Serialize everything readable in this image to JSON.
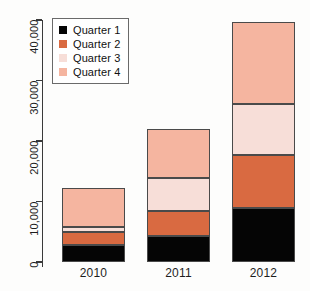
{
  "chart_data": {
    "type": "bar",
    "subtype": "stacked-bar",
    "title": "",
    "subtitle": "",
    "xlabel": "",
    "ylabel": "",
    "categories": [
      "2010",
      "2011",
      "2012"
    ],
    "series": [
      {
        "name": "Quarter 1",
        "color": "#050505",
        "values": [
          2800,
          4300,
          8900
        ]
      },
      {
        "name": "Quarter 2",
        "color": "#D96A41",
        "values": [
          2150,
          4150,
          8750
        ]
      },
      {
        "name": "Quarter 3",
        "color": "#F7DED8",
        "values": [
          800,
          5450,
          8400
        ]
      },
      {
        "name": "Quarter 4",
        "color": "#F5B5A0",
        "values": [
          6450,
          8100,
          13700
        ]
      }
    ],
    "totals": [
      12200,
      21400,
      40800
    ],
    "ylim": [
      0,
      40000
    ],
    "ytick_values": [
      0,
      10000,
      20000,
      30000,
      40000
    ],
    "ytick_labels": [
      "0",
      "10,000",
      "20,000",
      "30,000",
      "40,000"
    ],
    "grid": false,
    "legend_position": "top-left",
    "legend_entries": [
      "Quarter 1",
      "Quarter 2",
      "Quarter 3",
      "Quarter 4"
    ]
  },
  "axis": {
    "y_labels": [
      "0",
      "10,000",
      "20,000",
      "30,000",
      "40,000"
    ],
    "x_labels": [
      "2010",
      "2011",
      "2012"
    ]
  },
  "legend": {
    "items": [
      {
        "label": "Quarter 1",
        "color": "#050505"
      },
      {
        "label": "Quarter 2",
        "color": "#D96A41"
      },
      {
        "label": "Quarter 3",
        "color": "#F7DED8"
      },
      {
        "label": "Quarter 4",
        "color": "#F5B5A0"
      }
    ]
  }
}
